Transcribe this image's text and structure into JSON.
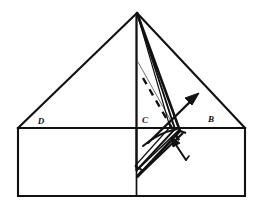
{
  "figure": {
    "background_color": "#ffffff",
    "stroke_color": "#111111",
    "labels": [
      {
        "name": "label-d",
        "text": "D",
        "x": 41,
        "y": 124
      },
      {
        "name": "label-c",
        "text": "C",
        "x": 145,
        "y": 123
      },
      {
        "name": "label-b",
        "text": "B",
        "x": 211,
        "y": 122
      }
    ],
    "outline": {
      "apex": [
        137,
        13
      ],
      "left_corner": [
        18,
        128
      ],
      "right_corner": [
        245,
        128
      ],
      "bottom_left": [
        18,
        196
      ],
      "bottom_right": [
        245,
        196
      ],
      "center_base": [
        137,
        128
      ],
      "center_bottom": [
        137,
        196
      ]
    },
    "flap": {
      "description": "folded triangular flap hinged at apex, pulled out to the right",
      "tip_bottom": [
        137,
        177
      ],
      "hinge_right": [
        182,
        130
      ]
    },
    "annotations": {
      "fold_arrow": {
        "name": "fold-direction-arrow",
        "from": [
          148,
          143
        ],
        "to": [
          196,
          96
        ]
      },
      "lift_arrow": {
        "name": "lift-arrow",
        "from": [
          184,
          158
        ],
        "to": [
          172,
          138
        ]
      },
      "crease_line": {
        "name": "dashed-crease-line",
        "from": [
          143,
          78
        ],
        "to": [
          180,
          142
        ]
      }
    }
  }
}
